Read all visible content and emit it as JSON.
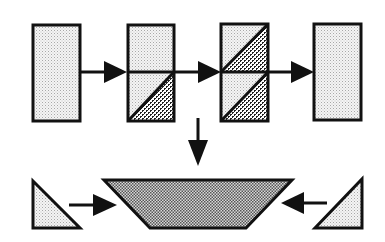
{
  "diagram": {
    "type": "process-flow",
    "colors": {
      "stroke": "#111111",
      "background": "#ffffff",
      "light_fill": "#ececec",
      "dot": "#9a9a9a",
      "crosshatch_dark": "#222222",
      "trapezoid_fill": "#8a8a8a"
    },
    "top_row": [
      {
        "id": "block-1",
        "shape": "rectangle",
        "fill": "light-dots"
      },
      {
        "id": "block-2",
        "shape": "rectangle-split",
        "top_fill": "light-dots",
        "bottom_fill": "diagonal-crosshatch-corner"
      },
      {
        "id": "block-3",
        "shape": "rectangle-split",
        "top_fill": "diagonal-crosshatch-corner",
        "bottom_fill": "diagonal-crosshatch-corner"
      },
      {
        "id": "block-4",
        "shape": "rectangle",
        "fill": "light-dots"
      }
    ],
    "bottom_row": [
      {
        "id": "left-triangle",
        "shape": "right-triangle",
        "fill": "light-dots"
      },
      {
        "id": "center-trapezoid",
        "shape": "inverted-trapezoid",
        "fill": "dense-dots"
      },
      {
        "id": "right-triangle",
        "shape": "right-triangle",
        "fill": "light-dots"
      }
    ],
    "arrows": [
      {
        "from": "block-1",
        "to": "block-2",
        "direction": "right"
      },
      {
        "from": "block-2",
        "to": "block-3",
        "direction": "right"
      },
      {
        "from": "block-3",
        "to": "block-4",
        "direction": "right"
      },
      {
        "from": "top-row",
        "to": "center-trapezoid",
        "direction": "down"
      },
      {
        "from": "left-triangle",
        "to": "center-trapezoid",
        "direction": "right"
      },
      {
        "from": "right-triangle",
        "to": "center-trapezoid",
        "direction": "left"
      }
    ]
  }
}
